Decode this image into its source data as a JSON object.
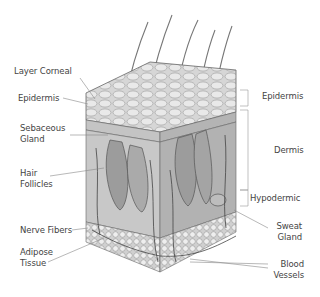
{
  "diagram": {
    "colors": {
      "background": "#ffffff",
      "tissue_light": "#d8d8d8",
      "tissue_mid": "#b8b8b8",
      "tissue_dark": "#8a8a8a",
      "outline": "#555555",
      "leader_line": "#888888",
      "label_text": "#444444"
    },
    "left_labels": [
      {
        "id": "layer-corneal",
        "lines": [
          "Layer Corneal"
        ]
      },
      {
        "id": "epidermis-left",
        "lines": [
          "Epidermis"
        ]
      },
      {
        "id": "sebaceous-gland",
        "lines": [
          "Sebaceous",
          "Gland"
        ]
      },
      {
        "id": "hair-follicles",
        "lines": [
          "Hair",
          "Follicles"
        ]
      },
      {
        "id": "nerve-fibers",
        "lines": [
          "Nerve Fibers"
        ]
      },
      {
        "id": "adipose-tissue",
        "lines": [
          "Adipose",
          "Tissue"
        ]
      }
    ],
    "right_labels": [
      {
        "id": "epidermis-right",
        "lines": [
          "Epidermis"
        ]
      },
      {
        "id": "dermis",
        "lines": [
          "Dermis"
        ]
      },
      {
        "id": "hypodermic",
        "lines": [
          "Hypodermic"
        ]
      },
      {
        "id": "sweat-gland",
        "lines": [
          "Sweat",
          "Gland"
        ]
      },
      {
        "id": "blood-vessels",
        "lines": [
          "Blood",
          "Vessels"
        ]
      }
    ]
  }
}
